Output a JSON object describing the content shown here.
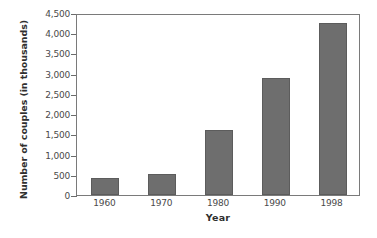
{
  "chart_data": {
    "type": "bar",
    "title": "",
    "subtitle": "",
    "xlabel": "Year",
    "ylabel": "Number of couples (in thousands)",
    "categories": [
      "1960",
      "1970",
      "1980",
      "1990",
      "1998"
    ],
    "values": [
      430,
      520,
      1600,
      2900,
      4250
    ],
    "series": [
      {
        "name": "Number of couples",
        "values": [
          430,
          520,
          1600,
          2900,
          4250
        ]
      }
    ],
    "ylim": [
      0,
      4500
    ],
    "y_ticks": [
      0,
      500,
      1000,
      1500,
      2000,
      2500,
      3000,
      3500,
      4000,
      4500
    ],
    "y_tick_labels": [
      "0",
      "500",
      "1,000",
      "1,500",
      "2,000",
      "2,500",
      "3,000",
      "3,500",
      "4,000",
      "4,500"
    ],
    "grid": false,
    "legend": "none",
    "bar_color": "#6e6e6e",
    "axis_color": "#7a7a7a",
    "background_color": "#ffffff",
    "annotations": []
  }
}
